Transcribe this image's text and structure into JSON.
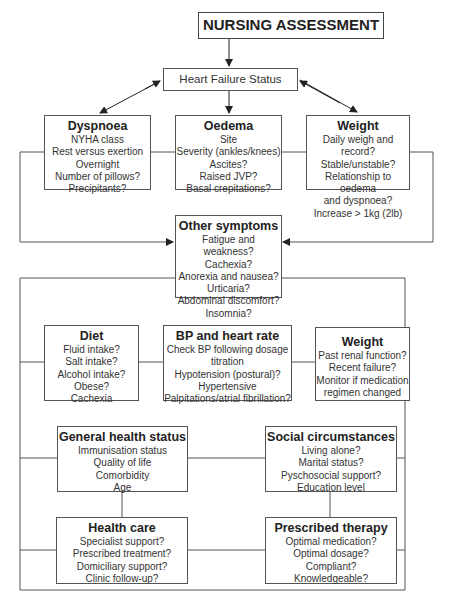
{
  "title": "NURSING ASSESSMENT",
  "status": "Heart Failure Status",
  "boxes": {
    "dyspnoea": {
      "title": "Dyspnoea",
      "lines": [
        "NYHA class",
        "Rest versus exertion",
        "Overnight",
        "Number of pillows?",
        "Precipitants?"
      ]
    },
    "oedema": {
      "title": "Oedema",
      "lines": [
        "Site",
        "Severity (ankles/knees)",
        "Ascites?",
        "Raised JVP?",
        "Basal crepitations?"
      ]
    },
    "weight_top": {
      "title": "Weight",
      "lines": [
        "Daily weigh and record?",
        "Stable/unstable?",
        "Relationship to oedema",
        "and dyspnoea?",
        "Increase > 1kg (2lb)"
      ]
    },
    "other": {
      "title": "Other symptoms",
      "lines": [
        "Fatigue and weakness?",
        "Cachexia?",
        "Anorexia and nausea?",
        "Urticaria?",
        "Abdominal discomfort?",
        "Insomnia?"
      ]
    },
    "diet": {
      "title": "Diet",
      "lines": [
        "Fluid intake?",
        "Salt intake?",
        "Alcohol intake?",
        "Obese?",
        "Cachexia"
      ]
    },
    "bp": {
      "title": "BP and heart rate",
      "lines": [
        "Check BP following dosage",
        "titration",
        "Hypotension (postural)?",
        "Hypertensive",
        "Palpitations/atrial fibrillation?"
      ]
    },
    "weight_mid": {
      "title": "Weight",
      "lines": [
        "Past renal function?",
        "Recent failure?",
        "Monitor if medication",
        "regimen changed"
      ]
    },
    "general": {
      "title": "General health status",
      "lines": [
        "Immunisation status",
        "Quality of life",
        "Comorbidity",
        "Age"
      ]
    },
    "social": {
      "title": "Social circumstances",
      "lines": [
        "Living alone?",
        "Marital status?",
        "Pyschosocial support?",
        "Education level"
      ]
    },
    "healthcare": {
      "title": "Health care",
      "lines": [
        "Specialist support?",
        "Prescribed treatment?",
        "Domiciliary support?",
        "Clinic follow-up?"
      ]
    },
    "therapy": {
      "title": "Prescribed therapy",
      "lines": [
        "Optimal medication?",
        "Optimal dosage?",
        "Compliant?",
        "Knowledgeable?"
      ]
    }
  }
}
